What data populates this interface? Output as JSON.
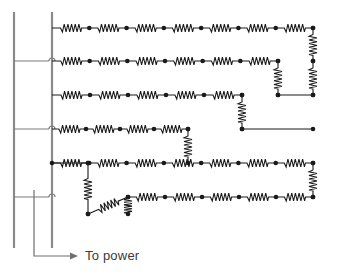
{
  "diagram": {
    "type": "electrical-schematic",
    "canvas": {
      "width": 339,
      "height": 277,
      "background": "#ffffff"
    },
    "colors": {
      "wire": "#1a1a1a",
      "node": "#1a1a1a",
      "bus": "#8a8a8a",
      "annotation": "#6f6f6f",
      "text": "#3b3b3b"
    },
    "annotation": {
      "label": "To power",
      "label_x": 85,
      "label_y": 257,
      "arrow": {
        "from_x": 34,
        "from_y": 190,
        "corner_x": 34,
        "corner_y": 256,
        "to_x": 78,
        "to_y": 256
      }
    },
    "bus_bars": [
      {
        "name": "outer-bus",
        "x": 14,
        "y1": 12,
        "y2": 248
      },
      {
        "name": "inner-bus",
        "x": 52,
        "y1": 12,
        "y2": 248
      }
    ],
    "bus_links": [
      {
        "name": "bus-link-row2",
        "x1": 14,
        "x2": 52,
        "y": 61
      },
      {
        "name": "bus-link-row4",
        "x1": 14,
        "x2": 52,
        "y": 129
      },
      {
        "name": "bus-link-row6",
        "x1": 14,
        "x2": 52,
        "y": 197
      }
    ],
    "rows": [
      {
        "id": 1,
        "y": 28,
        "x_start": 52,
        "x_end": 313,
        "resistor_count": 7
      },
      {
        "id": 2,
        "y": 61,
        "x_start": 52,
        "x_end": 278,
        "resistor_count": 6
      },
      {
        "id": 3,
        "y": 95,
        "x_start": 52,
        "x_end": 242,
        "resistor_count": 5
      },
      {
        "id": 4,
        "y": 129,
        "x_start": 52,
        "x_end": 188,
        "resistor_count": 4
      },
      {
        "id": 5,
        "y": 163,
        "x_start": 52,
        "x_end": 313,
        "resistor_count": 7
      },
      {
        "id": 6,
        "y": 197,
        "x_start": 128,
        "x_end": 313,
        "resistor_count": 5
      }
    ],
    "row_segments_extra": [
      {
        "name": "row3-right-run",
        "y": 95,
        "x1": 278,
        "x2": 313
      },
      {
        "name": "row4-right-run",
        "y": 129,
        "x1": 242,
        "x2": 313
      },
      {
        "name": "row5-left-stub",
        "y": 163,
        "x1": 52,
        "x2": 88
      }
    ],
    "vertical_resistors": [
      {
        "name": "vres-right-r1-r2",
        "x": 313,
        "y1": 28,
        "y2": 61
      },
      {
        "name": "vres-right-r2-r3",
        "x": 313,
        "y1": 61,
        "y2": 95
      },
      {
        "name": "vres-r2-r3-mid",
        "x": 278,
        "y1": 61,
        "y2": 95
      },
      {
        "name": "vres-r3-r4-mid",
        "x": 242,
        "y1": 95,
        "y2": 129
      },
      {
        "name": "vres-r4-r5-mid",
        "x": 188,
        "y1": 129,
        "y2": 163
      },
      {
        "name": "vres-right-r5-r6",
        "x": 313,
        "y1": 163,
        "y2": 197
      },
      {
        "name": "vres-left-r5-down",
        "x": 88,
        "y1": 163,
        "y2": 214
      },
      {
        "name": "vres-left-r6-down",
        "x": 128,
        "y1": 197,
        "y2": 214
      }
    ],
    "diagonal_resistors": [
      {
        "name": "dres-lower-left",
        "x1": 88,
        "y1": 214,
        "x2": 128,
        "y2": 197
      }
    ],
    "geometry": {
      "resistor_zigzag_peaks": 6,
      "resistor_body_length": 22,
      "resistor_amplitude": 4,
      "node_radius": 2.3
    }
  }
}
